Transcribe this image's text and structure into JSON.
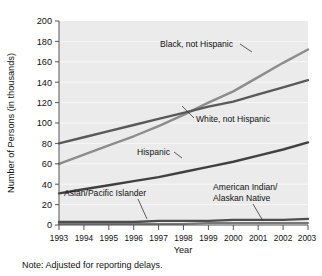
{
  "chart_data": {
    "type": "line",
    "title": "",
    "xlabel": "Year",
    "ylabel": "Number of Persons (in thousands)",
    "x": [
      1993,
      1994,
      1995,
      1996,
      1997,
      1998,
      1999,
      2000,
      2001,
      2002,
      2003
    ],
    "categories": [
      "1993",
      "1994",
      "1995",
      "1996",
      "1997",
      "1998",
      "1999",
      "2000",
      "2001",
      "2002",
      "2003"
    ],
    "xlim": [
      1993,
      2003
    ],
    "ylim": [
      0,
      200
    ],
    "yticks": [
      0,
      20,
      40,
      60,
      80,
      100,
      120,
      140,
      160,
      180,
      200
    ],
    "grid": true,
    "legend_position": "inline-annotations",
    "series": [
      {
        "name": "Black, not Hispanic",
        "color": "#8c8c8c",
        "values": [
          60,
          69,
          78,
          87,
          97,
          108,
          120,
          131,
          145,
          159,
          172
        ]
      },
      {
        "name": "White, not Hispanic",
        "color": "#595959",
        "values": [
          80,
          86,
          92,
          98,
          104,
          110,
          116,
          121,
          128,
          135,
          142
        ]
      },
      {
        "name": "Hispanic",
        "color": "#404040",
        "values": [
          31,
          35,
          39,
          43,
          47,
          52,
          57,
          62,
          68,
          74,
          81
        ]
      },
      {
        "name": "Asian/Pacific Islander",
        "color": "#4d4d4d",
        "values": [
          3,
          3,
          3,
          3,
          4,
          4,
          4,
          5,
          5,
          5,
          6
        ]
      },
      {
        "name": "American Indian/Alaskan Native",
        "color": "#777777",
        "values": [
          1,
          1,
          1,
          1,
          1,
          1,
          2,
          2,
          2,
          2,
          2
        ]
      }
    ],
    "annotations": [
      {
        "text": "Black, not Hispanic",
        "target_series": "Black, not Hispanic"
      },
      {
        "text": "White, not Hispanic",
        "target_series": "White, not Hispanic"
      },
      {
        "text": "Hispanic",
        "target_series": "Hispanic"
      },
      {
        "text": "Asian/Pacific Islander",
        "target_series": "Asian/Pacific Islander"
      },
      {
        "text": "American Indian/",
        "target_series": "American Indian/Alaskan Native"
      },
      {
        "text": "Alaskan Native",
        "target_series": "American Indian/Alaskan Native"
      }
    ],
    "note": "Note: Adjusted for reporting delays."
  },
  "labels": {
    "y_title": "Number of Persons (in thousands)",
    "x_title": "Year",
    "note": "Note: Adjusted for reporting delays.",
    "series_black": "Black, not Hispanic",
    "series_white": "White, not Hispanic",
    "series_hispanic": "Hispanic",
    "series_asian": "Asian/Pacific Islander",
    "series_amind_line1": "American Indian/",
    "series_amind_line2": "Alaskan Native",
    "y0": "0",
    "y20": "20",
    "y40": "40",
    "y60": "60",
    "y80": "80",
    "y100": "100",
    "y120": "120",
    "y140": "140",
    "y160": "160",
    "y180": "180",
    "y200": "200",
    "x1993": "1993",
    "x1994": "1994",
    "x1995": "1995",
    "x1996": "1996",
    "x1997": "1997",
    "x1998": "1998",
    "x1999": "1999",
    "x2000": "2000",
    "x2001": "2001",
    "x2002": "2002",
    "x2003": "2003"
  }
}
